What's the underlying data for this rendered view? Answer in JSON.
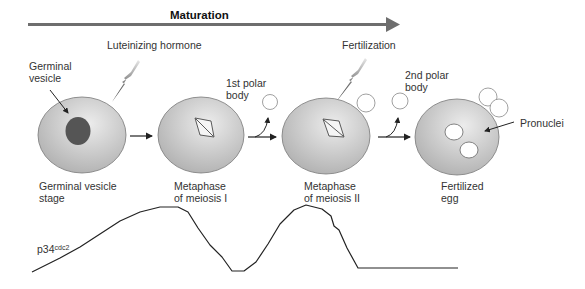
{
  "header": {
    "title": "Maturation"
  },
  "stimuli": {
    "lh_label": "Luteinizing hormone",
    "fertilization_label": "Fertilization"
  },
  "stages": [
    {
      "label_line1": "Germinal vesicle",
      "label_line2": "stage"
    },
    {
      "label_line1": "Metaphase",
      "label_line2": "of meiosis I"
    },
    {
      "label_line1": "Metaphase",
      "label_line2": "of meiosis II"
    },
    {
      "label_line1": "Fertilized",
      "label_line2": "egg"
    }
  ],
  "annotations": {
    "germinal_vesicle_line1": "Germinal",
    "germinal_vesicle_line2": "vesicle",
    "polar_body_1_line1": "1st polar",
    "polar_body_1_line2": "body",
    "polar_body_2_line1": "2nd polar",
    "polar_body_2_line2": "body",
    "pronuclei": "Pronuclei"
  },
  "graph": {
    "label_main": "p34",
    "label_sup": "cdc2",
    "curve_points": "32,272 60,258 80,247 100,234 120,221 140,212 160,207 178,207 188,212 198,228 210,245 222,257 232,271 244,271 256,262 268,244 280,224 294,210 306,205 322,209 331,216 334,226 339,230 347,248 358,268 458,268"
  },
  "colors": {
    "cell_fill_light": "#e6e6e6",
    "cell_fill_dark": "#b3b3b3",
    "nucleus": "#555555",
    "arrow": "#6e6e6e",
    "line": "#222222"
  }
}
